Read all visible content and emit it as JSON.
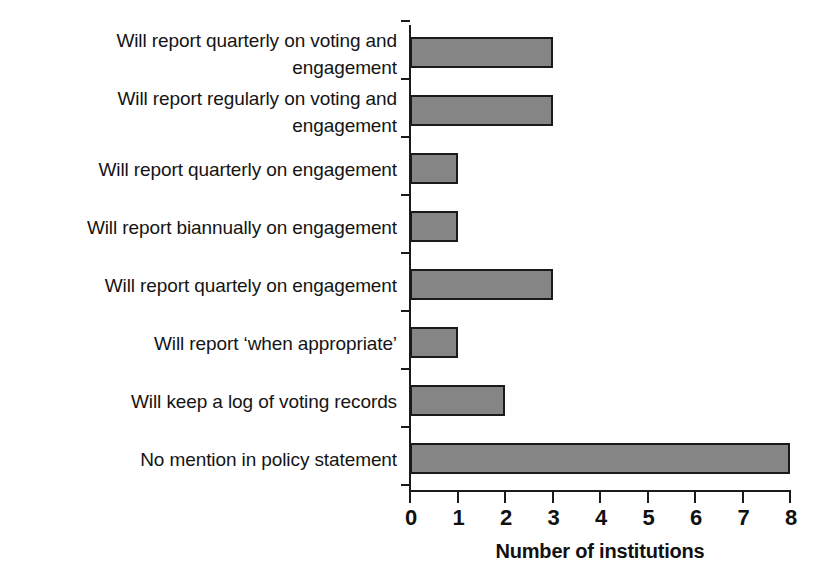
{
  "chart_data": {
    "type": "bar",
    "orientation": "horizontal",
    "title": "",
    "xlabel": "Number of institutions",
    "ylabel": "",
    "xlim": [
      0,
      8
    ],
    "xticks": [
      "0",
      "1",
      "2",
      "3",
      "4",
      "5",
      "6",
      "7",
      "8"
    ],
    "grid": false,
    "legend": false,
    "bar_color": "#858585",
    "bar_edge_color": "#1a1a1a",
    "categories": [
      "Will report quarterly on voting and\nengagement",
      "Will report regularly on voting and\nengagement",
      "Will report quarterly on engagement",
      "Will report biannually on engagement",
      "Will report quartely on engagement",
      "Will report ‘when appropriate’",
      "Will keep a log of voting records",
      "No mention in policy statement"
    ],
    "values": [
      3,
      3,
      1,
      1,
      3,
      1,
      2,
      8
    ]
  }
}
